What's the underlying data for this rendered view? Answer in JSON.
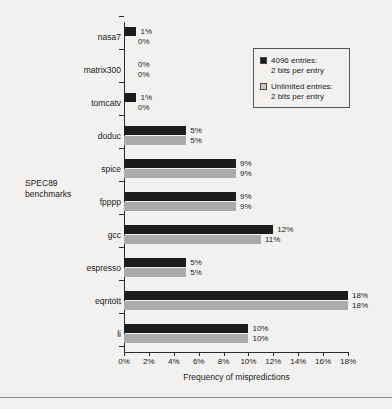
{
  "chart_data": {
    "type": "bar",
    "orientation": "horizontal",
    "title": "",
    "xlabel": "Frequency of mispredictions",
    "ylabel": "SPEC89 benchmarks",
    "ylabel_lines": [
      "SPEC89",
      "benchmarks"
    ],
    "xlim": [
      0,
      18
    ],
    "xticks": [
      0,
      2,
      4,
      6,
      8,
      10,
      12,
      14,
      16,
      18
    ],
    "xtick_labels": [
      "0%",
      "2%",
      "4%",
      "6%",
      "8%",
      "10%",
      "12%",
      "14%",
      "16%",
      "18%"
    ],
    "grid": false,
    "legend_position": "top-right",
    "categories": [
      "nasa7",
      "matrix300",
      "tomcatv",
      "doduc",
      "spice",
      "fpppp",
      "gcc",
      "espresso",
      "eqntott",
      "li"
    ],
    "series": [
      {
        "name": "4096 entries: 2 bits per entry",
        "color": "#1c1c1c",
        "values": [
          1,
          0,
          1,
          5,
          9,
          9,
          12,
          5,
          18,
          10
        ],
        "labels": [
          "1%",
          "0%",
          "1%",
          "5%",
          "9%",
          "9%",
          "12%",
          "5%",
          "18%",
          "10%"
        ]
      },
      {
        "name": "Unlimited entries: 2 bits per entry",
        "color": "#ababab",
        "values": [
          0,
          0,
          0,
          5,
          9,
          9,
          11,
          5,
          18,
          10
        ],
        "labels": [
          "0%",
          "0%",
          "0%",
          "5%",
          "9%",
          "9%",
          "11%",
          "5%",
          "18%",
          "10%"
        ]
      }
    ]
  },
  "legend": {
    "entries": [
      {
        "swatch": "dark",
        "line1": "4096 entries:",
        "line2": "2 bits per entry"
      },
      {
        "swatch": "light",
        "line1": "Unlimited entries:",
        "line2": "2 bits per entry"
      }
    ]
  }
}
